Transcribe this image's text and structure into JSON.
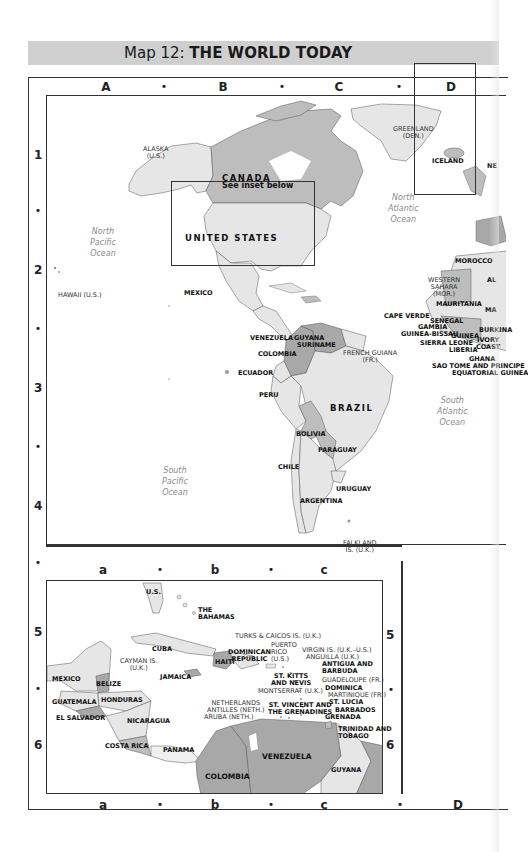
{
  "header": {
    "prefix": "Map 12: ",
    "title": "THE WORLD TODAY"
  },
  "grid": {
    "columns_top": [
      "A",
      "B",
      "C",
      "D"
    ],
    "columns_inset": [
      "a",
      "b",
      "c"
    ],
    "columns_bottom": [
      "a",
      "b",
      "c",
      "D"
    ],
    "rows_main": [
      "1",
      "2",
      "3",
      "4"
    ],
    "rows_inset": [
      "5",
      "6"
    ],
    "separator": "•"
  },
  "main_map": {
    "inset_note": "See inset below",
    "oceans": {
      "north_pacific": "North\nPacific\nOcean",
      "north_atlantic": "North\nAtlantic\nOcean",
      "south_pacific": "South\nPacific\nOcean",
      "south_atlantic": "South\nAtlantic\nOcean"
    },
    "labels": {
      "alaska": "ALASKA\n(U.S.)",
      "canada": "CANADA",
      "greenland": "GREENLAND\n(DEN.)",
      "iceland": "ICELAND",
      "united_states": "UNITED STATES",
      "mexico": "MEXICO",
      "hawaii": "HAWAII (U.S.)",
      "morocco": "MOROCCO",
      "western_sahara": "WESTERN\nSAHARA\n(MOR.)",
      "mauritania": "MAURITANIA",
      "cape_verde": "CAPE VERDE",
      "senegal": "SENEGAL",
      "gambia": "GAMBIA",
      "guinea_bissau": "GUINEA-BISSAU",
      "guinea": "GUINEA",
      "sierra_leone": "SIERRA LEONE",
      "ivory_coast": "IVORY\nCOAST",
      "liberia": "LIBERIA",
      "ghana": "GHANA",
      "burkina": "BURKINA",
      "sao_tome": "SAO TOME AND PRINCIPE",
      "equatorial_guinea": "EQUATORIAL GUINEA",
      "al": "AL",
      "ma": "MA",
      "ne": "NE",
      "venezuela": "VENEZUELA",
      "guyana": "GUYANA",
      "suriname": "SURINAME",
      "french_guiana": "FRENCH GUIANA\n(FR.)",
      "colombia": "COLOMBIA",
      "ecuador": "ECUADOR",
      "peru": "PERU",
      "brazil": "BRAZIL",
      "bolivia": "BOLIVIA",
      "paraguay": "PARAGUAY",
      "chile": "CHILE",
      "uruguay": "URUGUAY",
      "argentina": "ARGENTINA",
      "falkland": "FALKLAND\nIS. (U.K.)"
    }
  },
  "inset_map": {
    "labels": {
      "us": "U.S.",
      "the_bahamas": "THE\nBAHAMAS",
      "turks_caicos": "TURKS & CAICOS IS. (U.K.)",
      "cuba": "CUBA",
      "cayman": "CAYMAN IS.\n(U.K.)",
      "jamaica": "JAMAICA",
      "haiti": "HAITI",
      "dominican_republic": "DOMINICAN\nREPUBLIC",
      "puerto_rico": "PUERTO\nRICO\n(U.S.)",
      "virgin_is": "VIRGIN IS. (U.K.–U.S.)",
      "anguilla": "ANGUILLA (U.K.)",
      "antigua": "ANTIGUA AND\nBARBUDA",
      "st_kitts": "ST. KITTS\nAND NEVIS",
      "guadeloupe": "GUADELOUPE (FR.)",
      "montserrat": "MONTSERRAT (U.K.)",
      "dominica": "DOMINICA",
      "martinique": "MARTINIQUE (FR.)",
      "st_lucia": "ST. LUCIA",
      "st_vincent": "ST. VINCENT AND\nTHE GRENADINES",
      "barbados": "BARBADOS",
      "grenada": "GRENADA",
      "trinidad": "TRINIDAD AND\nTOBAGO",
      "netherlands_antilles": "NETHERLANDS\nANTILLES (NETH.)",
      "aruba": "ARUBA (NETH.)",
      "mexico": "MEXICO",
      "belize": "BELIZE",
      "guatemala": "GUATEMALA",
      "honduras": "HONDURAS",
      "el_salvador": "EL SALVADOR",
      "nicaragua": "NICARAGUA",
      "costa_rica": "COSTA RICA",
      "panama": "PANAMA",
      "colombia": "COLOMBIA",
      "venezuela": "VENEZUELA",
      "guyana": "GUYANA"
    }
  },
  "colors": {
    "light_land": "#e6e6e6",
    "mid_land": "#bdbdbd",
    "dark_land": "#a8a8a8",
    "title_bar": "#cfcfcf",
    "ocean_text": "#8a8a8a",
    "border": "#333333"
  }
}
